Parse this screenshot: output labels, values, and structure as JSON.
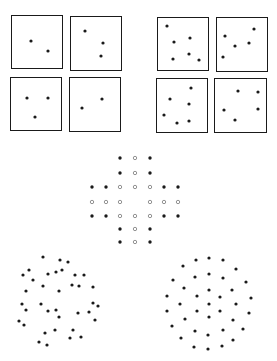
{
  "figure": {
    "width": 277,
    "height": 361,
    "background": "#ffffff",
    "ink": "#1a1a1a",
    "boxes": [
      {
        "x": 11,
        "y": 15,
        "w": 51,
        "h": 53,
        "dots": [
          [
            31,
            41
          ],
          [
            48,
            51
          ]
        ]
      },
      {
        "x": 70,
        "y": 16,
        "w": 51,
        "h": 54,
        "dots": [
          [
            85,
            31
          ],
          [
            103,
            43
          ],
          [
            101,
            56
          ]
        ]
      },
      {
        "x": 10,
        "y": 77,
        "w": 51,
        "h": 53,
        "dots": [
          [
            27,
            98
          ],
          [
            48,
            98
          ],
          [
            35,
            117
          ]
        ]
      },
      {
        "x": 69,
        "y": 77,
        "w": 51,
        "h": 54,
        "dots": [
          [
            102,
            99
          ],
          [
            82,
            108
          ]
        ]
      },
      {
        "x": 157,
        "y": 17,
        "w": 51,
        "h": 53,
        "dots": [
          [
            167,
            26
          ],
          [
            174,
            42
          ],
          [
            190,
            38
          ],
          [
            173,
            59
          ],
          [
            189,
            54
          ],
          [
            199,
            60
          ]
        ]
      },
      {
        "x": 216,
        "y": 17,
        "w": 51,
        "h": 54,
        "dots": [
          [
            254,
            29
          ],
          [
            225,
            36
          ],
          [
            235,
            46
          ],
          [
            249,
            43
          ],
          [
            223,
            57
          ]
        ]
      },
      {
        "x": 156,
        "y": 78,
        "w": 51,
        "h": 54,
        "dots": [
          [
            191,
            88
          ],
          [
            170,
            99
          ],
          [
            189,
            104
          ],
          [
            164,
            115
          ],
          [
            177,
            123
          ],
          [
            189,
            121
          ]
        ]
      },
      {
        "x": 214,
        "y": 78,
        "w": 52,
        "h": 54,
        "dots": [
          [
            238,
            91
          ],
          [
            258,
            92
          ],
          [
            224,
            110
          ],
          [
            258,
            109
          ],
          [
            235,
            120
          ]
        ]
      }
    ],
    "cross_pattern": {
      "filled": [
        [
          120,
          158
        ],
        [
          150,
          158
        ],
        [
          120,
          173
        ],
        [
          150,
          173
        ],
        [
          92,
          187
        ],
        [
          106,
          187
        ],
        [
          164,
          187
        ],
        [
          178,
          187
        ],
        [
          92,
          216
        ],
        [
          106,
          216
        ],
        [
          164,
          216
        ],
        [
          178,
          216
        ],
        [
          120,
          229
        ],
        [
          150,
          229
        ],
        [
          120,
          242
        ],
        [
          150,
          242
        ]
      ],
      "hollow": [
        [
          135,
          158
        ],
        [
          135,
          173
        ],
        [
          120,
          187
        ],
        [
          135,
          187
        ],
        [
          150,
          187
        ],
        [
          92,
          202
        ],
        [
          106,
          202
        ],
        [
          120,
          202
        ],
        [
          150,
          202
        ],
        [
          164,
          202
        ],
        [
          178,
          202
        ],
        [
          120,
          216
        ],
        [
          135,
          216
        ],
        [
          150,
          216
        ],
        [
          135,
          229
        ],
        [
          135,
          242
        ]
      ]
    },
    "random_cluster": [
      [
        43,
        257
      ],
      [
        60,
        260
      ],
      [
        68,
        262
      ],
      [
        29,
        270
      ],
      [
        62,
        270
      ],
      [
        56,
        272
      ],
      [
        48,
        274
      ],
      [
        23,
        275
      ],
      [
        75,
        275
      ],
      [
        84,
        275
      ],
      [
        33,
        280
      ],
      [
        72,
        285
      ],
      [
        79,
        286
      ],
      [
        43,
        286
      ],
      [
        93,
        287
      ],
      [
        59,
        291
      ],
      [
        26,
        291
      ],
      [
        22,
        304
      ],
      [
        41,
        304
      ],
      [
        93,
        303
      ],
      [
        98,
        306
      ],
      [
        26,
        310
      ],
      [
        48,
        311
      ],
      [
        56,
        310
      ],
      [
        78,
        313
      ],
      [
        89,
        312
      ],
      [
        59,
        317
      ],
      [
        19,
        321
      ],
      [
        95,
        320
      ],
      [
        24,
        325
      ],
      [
        55,
        330
      ],
      [
        73,
        330
      ],
      [
        45,
        333
      ],
      [
        70,
        338
      ],
      [
        81,
        337
      ],
      [
        39,
        342
      ],
      [
        47,
        345
      ]
    ],
    "regular_cluster": [
      [
        196,
        260
      ],
      [
        209,
        258
      ],
      [
        223,
        260
      ],
      [
        183,
        266
      ],
      [
        236,
        269
      ],
      [
        195,
        277
      ],
      [
        209,
        274
      ],
      [
        223,
        278
      ],
      [
        173,
        280
      ],
      [
        246,
        282
      ],
      [
        184,
        288
      ],
      [
        209,
        290
      ],
      [
        232,
        290
      ],
      [
        167,
        296
      ],
      [
        197,
        296
      ],
      [
        220,
        297
      ],
      [
        251,
        298
      ],
      [
        180,
        304
      ],
      [
        209,
        304
      ],
      [
        236,
        304
      ],
      [
        167,
        311
      ],
      [
        197,
        311
      ],
      [
        220,
        311
      ],
      [
        249,
        313
      ],
      [
        185,
        319
      ],
      [
        209,
        317
      ],
      [
        233,
        320
      ],
      [
        172,
        326
      ],
      [
        195,
        331
      ],
      [
        223,
        330
      ],
      [
        243,
        329
      ],
      [
        208,
        335
      ],
      [
        181,
        338
      ],
      [
        233,
        340
      ],
      [
        194,
        347
      ],
      [
        208,
        349
      ],
      [
        222,
        346
      ]
    ]
  }
}
